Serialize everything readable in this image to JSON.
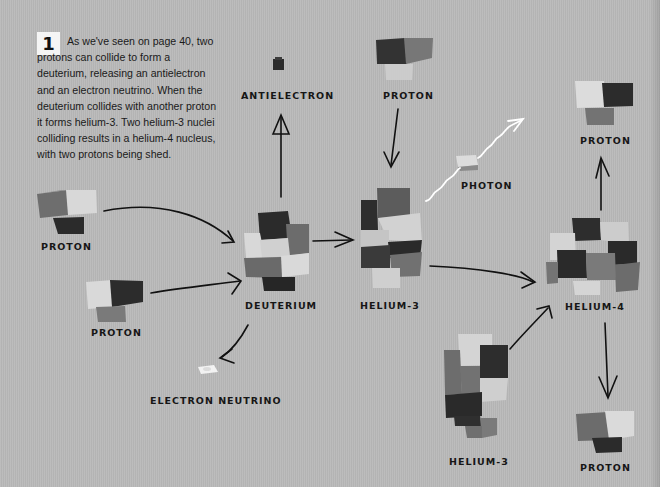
{
  "step": {
    "number": "1",
    "text": "As we've seen on page 40, two protons can collide to form a deuterium, releasing an antielectron and an electron neutrino. When the deuterium collides with another proton it forms helium-3. Two helium-3 nuclei colliding results in a helium-4 nucleus, with two protons being shed."
  },
  "labels": {
    "proton_left_top": "PROTON",
    "proton_left_bottom": "PROTON",
    "antielectron": "ANTIELECTRON",
    "proton_top": "PROTON",
    "deuterium": "DEUTERIUM",
    "helium3_top": "HELIUM-3",
    "photon": "PHOTON",
    "electron_neutrino": "ELECTRON NEUTRINO",
    "proton_right_top": "PROTON",
    "helium4": "HELIUM-4",
    "helium3_bottom": "HELIUM-3",
    "proton_right_bottom": "PROTON"
  },
  "colors": {
    "background": "#b9b9b9",
    "brick_dark": "#2e2e2e",
    "brick_mid": "#6f6f6f",
    "brick_light": "#d6d6d6",
    "arrow": "#111111",
    "photon_wave": "#ffffff"
  }
}
